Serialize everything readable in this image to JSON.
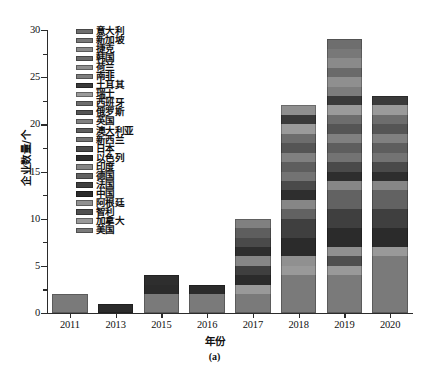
{
  "chart_data": {
    "type": "bar",
    "stacked": true,
    "title": "",
    "caption": "(a)",
    "xlabel": "年份",
    "ylabel": "企业数量/个",
    "categories": [
      "2011",
      "2013",
      "2015",
      "2016",
      "2017",
      "2018",
      "2019",
      "2020"
    ],
    "ylim": [
      0,
      30
    ],
    "yticks": [
      0,
      5,
      10,
      15,
      20,
      25,
      30
    ],
    "ytick_labels": [
      "0",
      "5",
      "10",
      "15",
      "20",
      "25",
      "30"
    ],
    "yminor_step": 2.5,
    "grid": false,
    "legend_position": "upper-left-inside",
    "totals": [
      2,
      1,
      4,
      3,
      10,
      21,
      27,
      22
    ],
    "series": [
      {
        "name": "意大利",
        "color": "#6e6e6e",
        "values": [
          0,
          0,
          0,
          0,
          0,
          0,
          1,
          0
        ]
      },
      {
        "name": "新加坡",
        "color": "#787878",
        "values": [
          0,
          0,
          0,
          0,
          0,
          0,
          1,
          0
        ]
      },
      {
        "name": "捷克",
        "color": "#8a8a8a",
        "values": [
          0,
          0,
          0,
          0,
          0,
          0,
          1,
          0
        ]
      },
      {
        "name": "韩国",
        "color": "#6a6a6a",
        "values": [
          0,
          0,
          0,
          0,
          0,
          0,
          1,
          0
        ]
      },
      {
        "name": "荷兰",
        "color": "#8f8f8f",
        "values": [
          0,
          0,
          0,
          0,
          0,
          1,
          1,
          0
        ]
      },
      {
        "name": "南非",
        "color": "#7d7d7d",
        "values": [
          0,
          0,
          0,
          0,
          0,
          0,
          1,
          0
        ]
      },
      {
        "name": "土耳其",
        "color": "#3a3a3a",
        "values": [
          0,
          0,
          0,
          0,
          0,
          1,
          1,
          1
        ]
      },
      {
        "name": "瑞士",
        "color": "#9a9a9a",
        "values": [
          0,
          0,
          0,
          0,
          0,
          1,
          1,
          1
        ]
      },
      {
        "name": "西班牙",
        "color": "#6d6d6d",
        "values": [
          0,
          0,
          0,
          0,
          0,
          1,
          1,
          1
        ]
      },
      {
        "name": "俄罗斯",
        "color": "#555555",
        "values": [
          0,
          0,
          0,
          0,
          0,
          1,
          1,
          1
        ]
      },
      {
        "name": "英国",
        "color": "#808080",
        "values": [
          0,
          0,
          0,
          0,
          1,
          1,
          1,
          1
        ]
      },
      {
        "name": "澳大利亚",
        "color": "#5e5e5e",
        "values": [
          0,
          0,
          0,
          0,
          1,
          1,
          1,
          1
        ]
      },
      {
        "name": "新西兰",
        "color": "#737373",
        "values": [
          0,
          0,
          0,
          0,
          0,
          1,
          1,
          1
        ]
      },
      {
        "name": "日本",
        "color": "#4a4a4a",
        "values": [
          0,
          0,
          0,
          0,
          1,
          1,
          1,
          1
        ]
      },
      {
        "name": "以色列",
        "color": "#2e2e2e",
        "values": [
          0,
          0,
          1,
          0,
          1,
          1,
          1,
          1
        ]
      },
      {
        "name": "印度",
        "color": "#868686",
        "values": [
          0,
          0,
          0,
          0,
          1,
          1,
          1,
          1
        ]
      },
      {
        "name": "德国",
        "color": "#626262",
        "values": [
          0,
          0,
          0,
          0,
          0,
          1,
          2,
          2
        ]
      },
      {
        "name": "法国",
        "color": "#3f3f3f",
        "values": [
          0,
          0,
          0,
          0,
          1,
          2,
          2,
          2
        ]
      },
      {
        "name": "中国",
        "color": "#2b2b2b",
        "values": [
          0,
          1,
          1,
          1,
          1,
          2,
          2,
          2
        ]
      },
      {
        "name": "阿根廷",
        "color": "#909090",
        "values": [
          0,
          0,
          0,
          0,
          0,
          1,
          1,
          0
        ]
      },
      {
        "name": "智利",
        "color": "#4f4f4f",
        "values": [
          0,
          0,
          0,
          0,
          0,
          0,
          1,
          0
        ]
      },
      {
        "name": "加拿大",
        "color": "#999999",
        "values": [
          0,
          0,
          0,
          0,
          1,
          1,
          1,
          1
        ]
      },
      {
        "name": "美国",
        "color": "#7a7a7a",
        "values": [
          2,
          0,
          2,
          2,
          2,
          4,
          4,
          6
        ]
      }
    ]
  }
}
